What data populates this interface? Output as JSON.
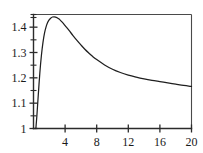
{
  "chart_data": {
    "type": "line",
    "title": "",
    "subtitle": "",
    "xlabel": "",
    "ylabel": "",
    "xlim": [
      0,
      20
    ],
    "ylim": [
      1,
      1.45
    ],
    "grid": false,
    "legend": null,
    "frame": "box",
    "x_ticks_major": [
      4,
      8,
      12,
      16,
      20
    ],
    "x_tick_labels": [
      "4",
      "8",
      "12",
      "16",
      "20"
    ],
    "y_ticks_major": [
      1,
      1.1,
      1.2,
      1.3,
      1.4
    ],
    "y_tick_labels": [
      "1",
      "1.1",
      "1.2",
      "1.3",
      "1.4"
    ],
    "y_ticks_minor": [
      1.05,
      1.15,
      1.25,
      1.35,
      1.45
    ],
    "series": [
      {
        "name": "curve",
        "color": "#1f1f1f",
        "x": [
          0.3,
          0.45,
          0.6,
          0.8,
          1.0,
          1.2,
          1.4,
          1.6,
          1.8,
          2.0,
          2.2,
          2.4,
          2.6,
          2.8,
          3.0,
          3.2,
          3.5,
          3.8,
          4.0,
          4.5,
          5.0,
          5.5,
          6.0,
          6.5,
          7.0,
          7.5,
          8.0,
          9.0,
          10.0,
          11.0,
          12.0,
          13.0,
          14.0,
          15.0,
          16.0,
          17.0,
          18.0,
          19.0,
          20.0
        ],
        "y": [
          1.0,
          1.06,
          1.13,
          1.218,
          1.288,
          1.34,
          1.377,
          1.402,
          1.419,
          1.43,
          1.436,
          1.44,
          1.441,
          1.44,
          1.437,
          1.433,
          1.424,
          1.414,
          1.406,
          1.387,
          1.367,
          1.348,
          1.33,
          1.313,
          1.298,
          1.284,
          1.272,
          1.251,
          1.234,
          1.221,
          1.211,
          1.203,
          1.196,
          1.19,
          1.185,
          1.18,
          1.175,
          1.17,
          1.166
        ]
      }
    ]
  }
}
